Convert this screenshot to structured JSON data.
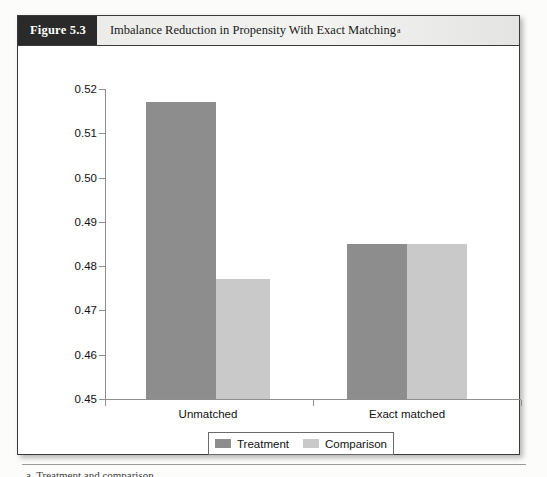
{
  "figure": {
    "number_label": "Figure 5.3",
    "title": "Imbalance Reduction in Propensity With Exact Matching",
    "title_footnote_marker": "a"
  },
  "footnote": {
    "text": "a. Treatment and comparison."
  },
  "colors": {
    "treatment": "#8d8d8d",
    "comparison": "#c9c9c9",
    "header_bar": "#2a2a2a",
    "axis": "#8f8f8f",
    "frame": "#3a3a3a"
  },
  "chart_data": {
    "type": "bar",
    "title": "Imbalance Reduction in Propensity With Exact Matching",
    "xlabel": "",
    "ylabel": "",
    "categories": [
      "Unmatched",
      "Exact matched"
    ],
    "series": [
      {
        "name": "Treatment",
        "values": [
          0.517,
          0.485
        ],
        "color": "#8d8d8d"
      },
      {
        "name": "Comparison",
        "values": [
          0.477,
          0.485
        ],
        "color": "#c9c9c9"
      }
    ],
    "ylim": [
      0.45,
      0.52
    ],
    "ytick_values": [
      0.45,
      0.46,
      0.47,
      0.48,
      0.49,
      0.5,
      0.51,
      0.52
    ],
    "ytick_labels": [
      "0.45",
      "0.46",
      "0.47",
      "0.48",
      "0.49",
      "0.50",
      "0.51",
      "0.52"
    ],
    "grid": false,
    "legend_position": "bottom-center",
    "legend_entries": [
      "Treatment",
      "Comparison"
    ]
  }
}
